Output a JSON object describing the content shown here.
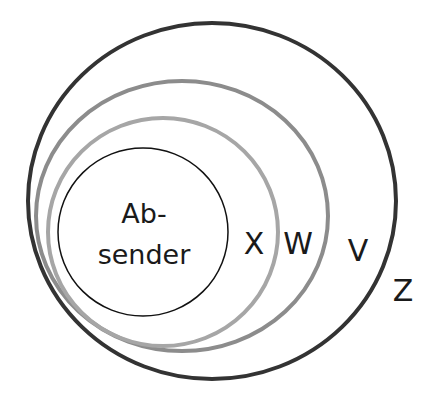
{
  "diagram": {
    "type": "nested-circles",
    "inner_label_line1": "Ab-",
    "inner_label_line2": "sender",
    "sets": [
      {
        "name": "X",
        "label": "X"
      },
      {
        "name": "W",
        "label": "W"
      },
      {
        "name": "V",
        "label": "V"
      },
      {
        "name": "Z",
        "label": "Z"
      }
    ],
    "colors": {
      "absender_stroke": "#111111",
      "w_stroke": "#a6a6a6",
      "v_stroke": "#8c8c8c",
      "z_stroke": "#333333",
      "text": "#1a1a1a"
    }
  }
}
